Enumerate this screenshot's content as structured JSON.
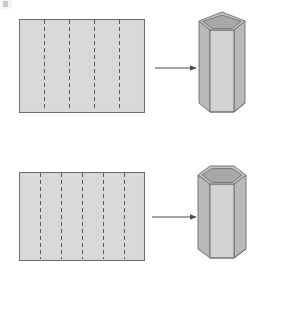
{
  "figure": {
    "background_color": "#ffffff",
    "panel_fill": "#d4d4d4",
    "panel_fill_light": "#dcdcdc",
    "face_fill_front": "#d2d2d2",
    "face_fill_side": "#b9b9b9",
    "face_fill_top": "#c4c4c4",
    "face_fill_inner": "#a8a8a8",
    "outline_color": "#6b6b6b",
    "dash_color": "#5a5a5a",
    "arrow_color": "#4d4d4d",
    "rows": [
      {
        "id": "row-pentagon",
        "net": {
          "name": "pentagonal-net",
          "shape": "rectangle",
          "x": 19,
          "y": 19,
          "width": 125,
          "height": 93,
          "panel_count": 5,
          "fold_line_count": 4,
          "fold_line_style": "dashed",
          "fold_line_positions": [
            44,
            69,
            94,
            119
          ]
        },
        "arrow": {
          "name": "fold-arrow-top",
          "x1": 155,
          "y1": 68,
          "x2": 196,
          "y2": 68,
          "direction": "right"
        },
        "solid": {
          "name": "pentagonal-prism",
          "sides": 5,
          "open_top": true,
          "center_x": 222,
          "top_y": 12,
          "bottom_y": 112,
          "half_width": 23,
          "ellipse_ry": 9
        }
      },
      {
        "id": "row-hexagon",
        "net": {
          "name": "hexagonal-net",
          "shape": "rectangle",
          "x": 19,
          "y": 172,
          "width": 125,
          "height": 88,
          "panel_count": 6,
          "fold_line_count": 5,
          "fold_line_style": "dashed",
          "fold_line_positions": [
            40,
            61,
            82,
            103,
            124
          ]
        },
        "arrow": {
          "name": "fold-arrow-bottom",
          "x1": 152,
          "y1": 217,
          "x2": 196,
          "y2": 217,
          "direction": "right"
        },
        "solid": {
          "name": "hexagonal-prism",
          "sides": 6,
          "open_top": true,
          "center_x": 222,
          "top_y": 166,
          "bottom_y": 258,
          "half_width": 24,
          "ellipse_ry": 9
        }
      }
    ],
    "artifacts": {
      "scan_speck": {
        "name": "scan-artifact-speck",
        "x": 3,
        "y": 1
      }
    }
  }
}
